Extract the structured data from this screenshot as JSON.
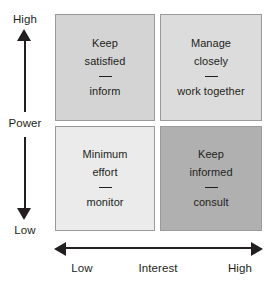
{
  "diagram": {
    "y_axis": {
      "name": "Power",
      "high_label": "High",
      "low_label": "Low"
    },
    "x_axis": {
      "name": "Interest",
      "low_label": "Low",
      "high_label": "High"
    },
    "quadrants": [
      {
        "id": "high-power-low-interest",
        "strategy": "Keep satisfied",
        "line1": "Keep",
        "line2": "satisfied",
        "action": "inform",
        "fill": "#d4d4d4",
        "border": "#9a9a9a"
      },
      {
        "id": "high-power-high-interest",
        "strategy": "Manage closely",
        "line1": "Manage",
        "line2": "closely",
        "action": "work together",
        "fill": "#dcdcdc",
        "border": "#9a9a9a"
      },
      {
        "id": "low-power-low-interest",
        "strategy": "Minimum effort",
        "line1": "Minimum",
        "line2": "effort",
        "action": "monitor",
        "fill": "#ebebeb",
        "border": "#9a9a9a"
      },
      {
        "id": "low-power-high-interest",
        "strategy": "Keep informed",
        "line1": "Keep",
        "line2": "informed",
        "action": "consult",
        "fill": "#b0b0b0",
        "border": "#9a9a9a"
      }
    ]
  }
}
